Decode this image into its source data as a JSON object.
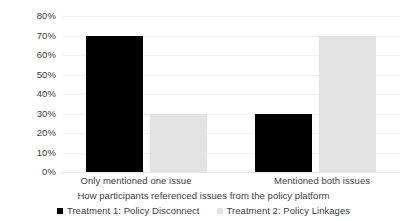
{
  "chart_data": {
    "type": "bar",
    "title": "",
    "xlabel": "How participants referenced issues from the policy platform",
    "ylabel": "",
    "categories": [
      "Only mentioned one issue",
      "Mentioned both issues"
    ],
    "series": [
      {
        "name": "Treatment 1: Policy Disconnect",
        "color": "#000000",
        "values": [
          70,
          30
        ]
      },
      {
        "name": "Treatment 2: Policy Linkages",
        "color": "#e3e3e3",
        "values": [
          30,
          70
        ]
      }
    ],
    "ylim": [
      0,
      80
    ],
    "ytick_labels": [
      "80%",
      "70%",
      "60%",
      "50%",
      "40%",
      "30%",
      "20%",
      "10%",
      "0%"
    ],
    "ytick_values": [
      80,
      70,
      60,
      50,
      40,
      30,
      20,
      10,
      0
    ],
    "grid": true,
    "legend_position": "bottom"
  }
}
